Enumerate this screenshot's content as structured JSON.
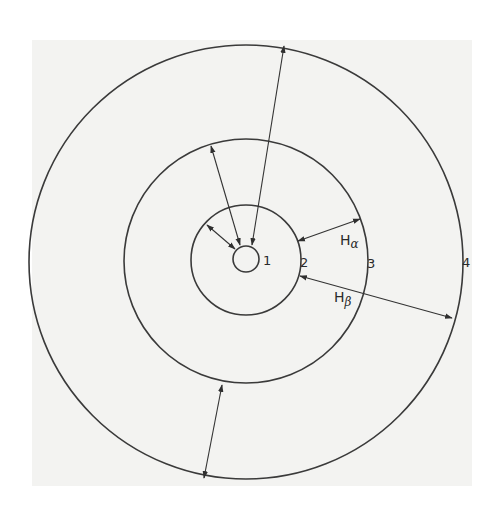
{
  "diagram": {
    "colors": {
      "line": "#3a3a3a",
      "background": "#ffffff",
      "page_tint": "#f3f3f1"
    },
    "center": {
      "x": 246,
      "y": 259
    },
    "circles": [
      {
        "id": "1",
        "label": "1",
        "r": 13
      },
      {
        "id": "2",
        "label": "2",
        "r": 55
      },
      {
        "id": "3",
        "label": "3",
        "r": 122
      },
      {
        "id": "4",
        "label": "4",
        "r": 217
      }
    ],
    "labels": {
      "region_1": "1",
      "region_2": "2",
      "region_3": "3",
      "region_4": "4",
      "h_alpha_main": "H",
      "h_alpha_sub": "α",
      "h_beta_main": "H",
      "h_beta_sub": "β"
    },
    "arrows": [
      {
        "name": "arrow-circle2-to-core",
        "from": [
          207,
          225
        ],
        "to": [
          235,
          249
        ]
      },
      {
        "name": "arrow-circle3-to-core",
        "from": [
          211,
          146
        ],
        "to": [
          240,
          245
        ]
      },
      {
        "name": "arrow-outer-to-core",
        "from": [
          284,
          46
        ],
        "to": [
          252,
          245
        ]
      },
      {
        "name": "arrow-h-alpha",
        "from": [
          298,
          241
        ],
        "to": [
          360,
          219
        ]
      },
      {
        "name": "arrow-h-beta",
        "from": [
          300,
          276
        ],
        "to": [
          452,
          318
        ]
      },
      {
        "name": "arrow-bottom",
        "from": [
          222,
          385
        ],
        "to": [
          204,
          478
        ]
      }
    ]
  }
}
